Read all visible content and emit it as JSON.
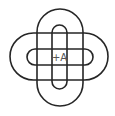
{
  "diagram": {
    "title": "",
    "center_label": "+A",
    "stroke_color": "#262626",
    "label_color": "#555555",
    "shapes": [
      {
        "name": "outer-vertical-stadium",
        "x": 37,
        "y": 9,
        "width": 46,
        "height": 97
      },
      {
        "name": "outer-horizontal-stadium",
        "x": 10,
        "y": 33,
        "width": 98,
        "height": 47
      },
      {
        "name": "inner-vertical-stadium",
        "x": 52,
        "y": 25,
        "width": 15,
        "height": 64
      },
      {
        "name": "inner-horizontal-stadium",
        "x": 27,
        "y": 49,
        "width": 66,
        "height": 16
      }
    ]
  }
}
